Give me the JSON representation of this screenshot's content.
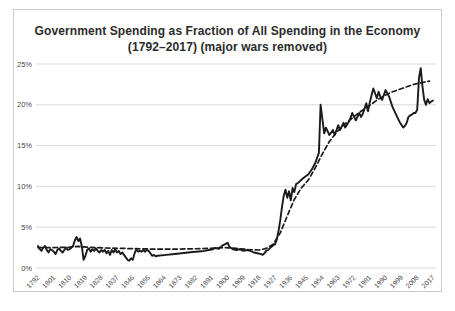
{
  "style": {
    "title_color": "#2b2b2b",
    "line_color": "#1a1a1a",
    "grid_color": "#d9d9d9",
    "tick_color": "#4a4a4a",
    "frame_border": "#cbcbcb",
    "background": "#ffffff"
  },
  "chart_data": {
    "type": "line",
    "title": "Government Spending as Fraction of All Spending in the Economy (1792–2017) (major wars removed)",
    "xlabel": "",
    "ylabel": "",
    "xlim": [
      1792,
      2017
    ],
    "ylim": [
      0,
      25
    ],
    "grid": "horizontal",
    "legend": "none",
    "x_ticks": [
      1792,
      1801,
      1810,
      1819,
      1828,
      1837,
      1846,
      1855,
      1864,
      1873,
      1882,
      1891,
      1900,
      1909,
      1918,
      1927,
      1936,
      1945,
      1954,
      1963,
      1972,
      1981,
      1990,
      1999,
      2008,
      2017
    ],
    "y_ticks": [
      {
        "value": 0,
        "label": "0%"
      },
      {
        "value": 5,
        "label": "5%"
      },
      {
        "value": 10,
        "label": "10%"
      },
      {
        "value": 15,
        "label": "15%"
      },
      {
        "value": 20,
        "label": "20%"
      },
      {
        "value": 25,
        "label": "25%"
      }
    ],
    "series": [
      {
        "name": "government spending share (actual)",
        "style": "solid",
        "points": [
          [
            1792,
            2.7
          ],
          [
            1793,
            2.3
          ],
          [
            1794,
            2.1
          ],
          [
            1795,
            2.5
          ],
          [
            1796,
            2.7
          ],
          [
            1797,
            2.2
          ],
          [
            1798,
            1.9
          ],
          [
            1799,
            2.3
          ],
          [
            1800,
            2.2
          ],
          [
            1801,
            2.0
          ],
          [
            1802,
            1.7
          ],
          [
            1803,
            2.2
          ],
          [
            1804,
            2.4
          ],
          [
            1805,
            2.1
          ],
          [
            1806,
            1.9
          ],
          [
            1807,
            2.2
          ],
          [
            1808,
            2.5
          ],
          [
            1809,
            2.2
          ],
          [
            1810,
            2.3
          ],
          [
            1811,
            2.5
          ],
          [
            1812,
            2.7
          ],
          [
            1813,
            3.4
          ],
          [
            1814,
            3.8
          ],
          [
            1815,
            3.3
          ],
          [
            1816,
            3.6
          ],
          [
            1817,
            2.6
          ],
          [
            1818,
            1.0
          ],
          [
            1819,
            1.5
          ],
          [
            1820,
            2.2
          ],
          [
            1821,
            2.4
          ],
          [
            1822,
            2.0
          ],
          [
            1823,
            2.3
          ],
          [
            1824,
            2.1
          ],
          [
            1825,
            2.4
          ],
          [
            1826,
            2.1
          ],
          [
            1827,
            1.9
          ],
          [
            1828,
            2.2
          ],
          [
            1829,
            2.0
          ],
          [
            1830,
            2.2
          ],
          [
            1831,
            1.8
          ],
          [
            1832,
            2.1
          ],
          [
            1833,
            1.6
          ],
          [
            1834,
            2.2
          ],
          [
            1835,
            1.9
          ],
          [
            1836,
            2.3
          ],
          [
            1837,
            1.9
          ],
          [
            1838,
            2.1
          ],
          [
            1839,
            1.7
          ],
          [
            1840,
            1.9
          ],
          [
            1841,
            1.6
          ],
          [
            1842,
            1.3
          ],
          [
            1843,
            1.0
          ],
          [
            1844,
            0.9
          ],
          [
            1845,
            1.2
          ],
          [
            1846,
            1.0
          ],
          [
            1847,
            1.8
          ],
          [
            1848,
            2.3
          ],
          [
            1849,
            2.0
          ],
          [
            1850,
            2.1
          ],
          [
            1851,
            2.0
          ],
          [
            1852,
            2.2
          ],
          [
            1853,
            2.0
          ],
          [
            1854,
            2.2
          ],
          [
            1855,
            2.1
          ],
          [
            1856,
            1.8
          ],
          [
            1857,
            1.5
          ],
          [
            1858,
            1.6
          ],
          [
            1859,
            1.45
          ],
          [
            1860,
            1.5
          ],
          [
            1865,
            1.6
          ],
          [
            1870,
            1.72
          ],
          [
            1875,
            1.84
          ],
          [
            1880,
            1.96
          ],
          [
            1885,
            2.06
          ],
          [
            1887,
            2.1
          ],
          [
            1889,
            2.2
          ],
          [
            1891,
            2.25
          ],
          [
            1893,
            2.45
          ],
          [
            1895,
            2.35
          ],
          [
            1897,
            2.75
          ],
          [
            1899,
            2.95
          ],
          [
            1900,
            3.1
          ],
          [
            1901,
            2.6
          ],
          [
            1903,
            2.3
          ],
          [
            1905,
            2.2
          ],
          [
            1907,
            2.3
          ],
          [
            1909,
            2.1
          ],
          [
            1911,
            2.2
          ],
          [
            1913,
            2.1
          ],
          [
            1915,
            1.9
          ],
          [
            1917,
            1.8
          ],
          [
            1919,
            1.7
          ],
          [
            1920,
            1.6
          ],
          [
            1921,
            1.8
          ],
          [
            1922,
            2.1
          ],
          [
            1923,
            2.2
          ],
          [
            1924,
            2.4
          ],
          [
            1925,
            2.6
          ],
          [
            1926,
            2.8
          ],
          [
            1927,
            2.9
          ],
          [
            1928,
            3.5
          ],
          [
            1929,
            4.5
          ],
          [
            1930,
            5.9
          ],
          [
            1931,
            7.5
          ],
          [
            1932,
            8.9
          ],
          [
            1933,
            9.6
          ],
          [
            1934,
            8.6
          ],
          [
            1935,
            9.4
          ],
          [
            1936,
            8.3
          ],
          [
            1937,
            9.8
          ],
          [
            1938,
            9.3
          ],
          [
            1939,
            10.3
          ],
          [
            1940,
            10.4
          ],
          [
            1943,
            11.0
          ],
          [
            1946,
            11.5
          ],
          [
            1948,
            12.1
          ],
          [
            1950,
            12.9
          ],
          [
            1951,
            13.5
          ],
          [
            1952,
            14.1
          ],
          [
            1953,
            20.0
          ],
          [
            1955,
            16.5
          ],
          [
            1956,
            17.2
          ],
          [
            1958,
            16.3
          ],
          [
            1960,
            16.9
          ],
          [
            1961,
            16.3
          ],
          [
            1963,
            17.5
          ],
          [
            1964,
            16.9
          ],
          [
            1966,
            17.8
          ],
          [
            1967,
            17.2
          ],
          [
            1969,
            17.9
          ],
          [
            1970,
            18.4
          ],
          [
            1971,
            19.0
          ],
          [
            1973,
            18.1
          ],
          [
            1975,
            19.0
          ],
          [
            1976,
            18.5
          ],
          [
            1977,
            18.9
          ],
          [
            1978,
            19.5
          ],
          [
            1979,
            20.2
          ],
          [
            1980,
            19.2
          ],
          [
            1981,
            20.3
          ],
          [
            1982,
            21.2
          ],
          [
            1983,
            22.0
          ],
          [
            1984,
            21.4
          ],
          [
            1985,
            20.8
          ],
          [
            1986,
            21.6
          ],
          [
            1987,
            21.0
          ],
          [
            1988,
            20.6
          ],
          [
            1989,
            21.2
          ],
          [
            1990,
            21.8
          ],
          [
            1992,
            21.0
          ],
          [
            1994,
            19.7
          ],
          [
            1996,
            18.8
          ],
          [
            1998,
            17.9
          ],
          [
            2000,
            17.2
          ],
          [
            2001,
            17.4
          ],
          [
            2002,
            17.8
          ],
          [
            2003,
            18.5
          ],
          [
            2004,
            18.7
          ],
          [
            2005,
            18.8
          ],
          [
            2006,
            19.0
          ],
          [
            2007,
            19.0
          ],
          [
            2008,
            19.4
          ],
          [
            2009,
            23.3
          ],
          [
            2010,
            24.5
          ],
          [
            2011,
            22.2
          ],
          [
            2012,
            20.6
          ],
          [
            2013,
            20.0
          ],
          [
            2014,
            20.7
          ],
          [
            2015,
            20.2
          ],
          [
            2016,
            20.4
          ],
          [
            2017,
            20.5
          ]
        ]
      },
      {
        "name": "smoothed trend",
        "style": "dashed",
        "points": [
          [
            1792,
            2.5
          ],
          [
            1800,
            2.5
          ],
          [
            1810,
            2.55
          ],
          [
            1815,
            2.65
          ],
          [
            1820,
            2.55
          ],
          [
            1830,
            2.45
          ],
          [
            1840,
            2.4
          ],
          [
            1850,
            2.35
          ],
          [
            1860,
            2.3
          ],
          [
            1870,
            2.3
          ],
          [
            1880,
            2.35
          ],
          [
            1890,
            2.4
          ],
          [
            1898,
            2.5
          ],
          [
            1905,
            2.4
          ],
          [
            1912,
            2.25
          ],
          [
            1918,
            2.2
          ],
          [
            1922,
            2.4
          ],
          [
            1926,
            2.9
          ],
          [
            1930,
            4.3
          ],
          [
            1934,
            6.4
          ],
          [
            1938,
            8.4
          ],
          [
            1942,
            9.8
          ],
          [
            1946,
            10.8
          ],
          [
            1950,
            12.3
          ],
          [
            1954,
            14.0
          ],
          [
            1958,
            15.5
          ],
          [
            1962,
            16.6
          ],
          [
            1966,
            17.5
          ],
          [
            1970,
            18.2
          ],
          [
            1974,
            18.9
          ],
          [
            1978,
            19.5
          ],
          [
            1982,
            20.1
          ],
          [
            1986,
            20.7
          ],
          [
            1990,
            21.2
          ],
          [
            1994,
            21.6
          ],
          [
            1998,
            21.9
          ],
          [
            2002,
            22.2
          ],
          [
            2006,
            22.5
          ],
          [
            2010,
            22.7
          ],
          [
            2015,
            22.9
          ]
        ]
      }
    ]
  }
}
